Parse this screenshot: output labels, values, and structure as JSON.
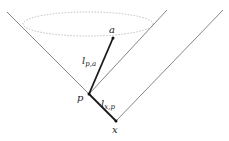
{
  "diagram": {
    "points": {
      "a": {
        "label": "a",
        "x": 113,
        "y": 38
      },
      "p": {
        "label": "p",
        "x": 89,
        "y": 94
      },
      "x": {
        "label": "x",
        "x": 116,
        "y": 121
      }
    },
    "edge_labels": {
      "l_pa": {
        "base": "l",
        "sub": "p,a"
      },
      "l_xp": {
        "base": "l",
        "sub": "x,p"
      }
    },
    "colors": {
      "cone_line": "#777777",
      "thick_edge": "#1a1a1a",
      "ellipse": "#b0b0b0"
    }
  }
}
